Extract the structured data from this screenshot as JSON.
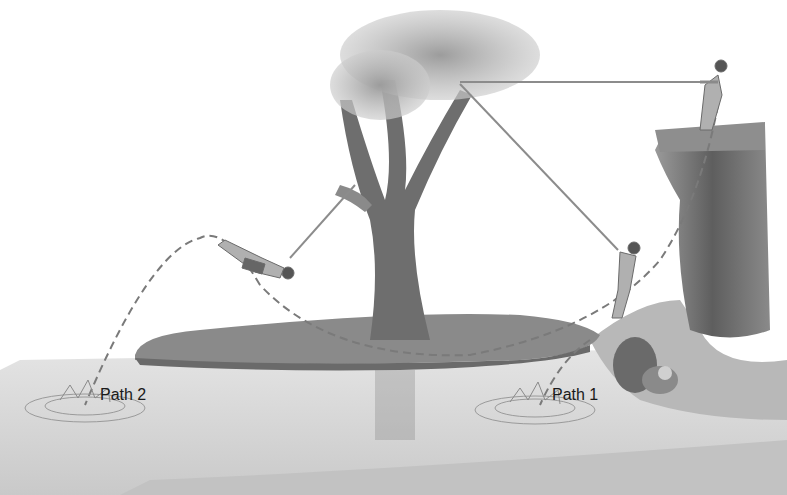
{
  "figure": {
    "labels": {
      "path1": "Path 1",
      "path2": "Path 2"
    },
    "elements": [
      "tree",
      "island",
      "water",
      "cliff",
      "rocks",
      "rope",
      "boy-on-cliff",
      "boy-mid-swing",
      "boy-released-path2"
    ],
    "colors": {
      "background": "#ffffff",
      "water": "#d8d8d8",
      "grass": "#8a8a8a",
      "tree": "#6e6e6e",
      "cliff": "#707070",
      "rope": "#8c8c8c",
      "path_dash": "#7a7a7a"
    }
  }
}
